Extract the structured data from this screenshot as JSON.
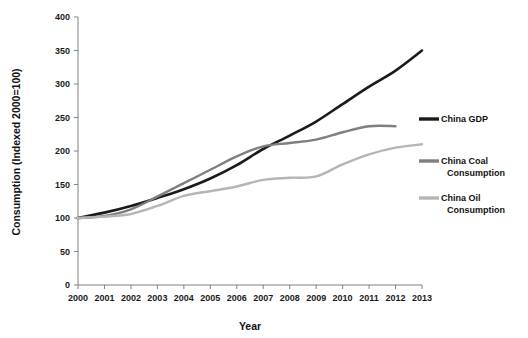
{
  "chart_data": {
    "type": "line",
    "title": "",
    "xlabel": "Year",
    "ylabel": "Consumption (Indexed 2000=100)",
    "categories": [
      "2000",
      "2001",
      "2002",
      "2003",
      "2004",
      "2005",
      "2006",
      "2007",
      "2008",
      "2009",
      "2010",
      "2011",
      "2012",
      "2013"
    ],
    "x": [
      2000,
      2001,
      2002,
      2003,
      2004,
      2005,
      2006,
      2007,
      2008,
      2009,
      2010,
      2011,
      2012,
      2013
    ],
    "xlim": [
      2000,
      2013
    ],
    "ylim": [
      0,
      400
    ],
    "yticks": [
      0,
      50,
      100,
      150,
      200,
      250,
      300,
      350,
      400
    ],
    "ytick_labels": [
      "0",
      "50",
      "100",
      "150",
      "200",
      "250",
      "300",
      "350",
      "400"
    ],
    "grid": false,
    "legend_position": "right",
    "series": [
      {
        "name": "China GDP",
        "color": "#1a1a1a",
        "x": [
          2000,
          2001,
          2002,
          2003,
          2004,
          2005,
          2006,
          2007,
          2008,
          2009,
          2010,
          2011,
          2012,
          2013
        ],
        "values": [
          100,
          108,
          118,
          130,
          143,
          159,
          179,
          203,
          223,
          244,
          270,
          296,
          320,
          350
        ]
      },
      {
        "name": "China Coal Consumption",
        "color": "#7f7f7f",
        "x": [
          2000,
          2001,
          2002,
          2003,
          2004,
          2005,
          2006,
          2007,
          2008,
          2009,
          2010,
          2011,
          2012
        ],
        "values": [
          100,
          103,
          113,
          132,
          152,
          172,
          192,
          207,
          212,
          217,
          228,
          237,
          237
        ]
      },
      {
        "name": "China Oil Consumption",
        "color": "#b5b5b5",
        "x": [
          2000,
          2001,
          2002,
          2003,
          2004,
          2005,
          2006,
          2007,
          2008,
          2009,
          2010,
          2011,
          2012,
          2013
        ],
        "values": [
          100,
          102,
          106,
          118,
          133,
          140,
          147,
          157,
          160,
          162,
          180,
          195,
          205,
          210
        ]
      }
    ]
  },
  "legend": {
    "entries": [
      {
        "label_line1": "China GDP",
        "label_line2": ""
      },
      {
        "label_line1": "China Coal",
        "label_line2": "Consumption"
      },
      {
        "label_line1": "China Oil",
        "label_line2": "Consumption"
      }
    ]
  },
  "colors": {
    "gdp": "#1a1a1a",
    "coal": "#7f7f7f",
    "oil": "#b5b5b5",
    "axis": "#808080",
    "text": "#111111",
    "background": "#ffffff"
  }
}
